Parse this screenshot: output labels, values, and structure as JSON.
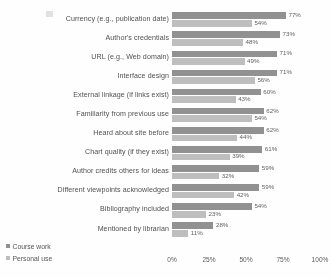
{
  "chart_data": {
    "type": "bar",
    "orientation": "horizontal",
    "title": "",
    "subtitle": "",
    "xlabel": "",
    "ylabel": "",
    "xlim": [
      0,
      100
    ],
    "xticks": [
      "0%",
      "25%",
      "50%",
      "75%",
      "100%"
    ],
    "xtick_values": [
      0,
      25,
      50,
      75,
      100
    ],
    "grid": false,
    "legend_position": "bottom-left",
    "value_suffix": "%",
    "categories": [
      "Currency (e.g., publication date)",
      "Author's credentials",
      "URL (e.g., Web domain)",
      "Interface design",
      "External linkage (if links exist)",
      "Familiarity from previous use",
      "Heard about site before",
      "Chart quality (if they exist)",
      "Author credits others for ideas",
      "Different viewpoints acknowledged",
      "Bibliography included",
      "Mentioned by librarian"
    ],
    "series": [
      {
        "name": "Course work",
        "color": "#8e8e8e",
        "values": [
          77,
          73,
          71,
          71,
          60,
          62,
          62,
          61,
          59,
          59,
          54,
          28
        ],
        "labels": [
          "77%",
          "73%",
          "71%",
          "71%",
          "60%",
          "62%",
          "62%",
          "61%",
          "59%",
          "59%",
          "54%",
          "28%"
        ]
      },
      {
        "name": "Personal use",
        "color": "#bdbdbd",
        "values": [
          54,
          48,
          49,
          56,
          43,
          54,
          44,
          39,
          32,
          42,
          23,
          11
        ],
        "labels": [
          "54%",
          "48%",
          "49%",
          "56%",
          "43%",
          "54%",
          "44%",
          "39%",
          "32%",
          "42%",
          "23%",
          "11%"
        ]
      }
    ]
  },
  "legend": {
    "items": [
      {
        "label": "Course work",
        "color": "#8e8e8e"
      },
      {
        "label": "Personal use",
        "color": "#bdbdbd"
      }
    ]
  }
}
